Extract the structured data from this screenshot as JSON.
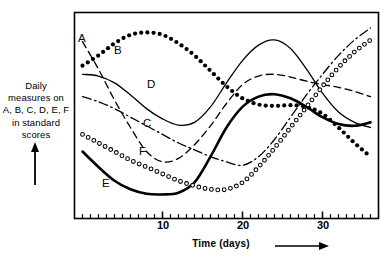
{
  "figure": {
    "kind": "line-chart",
    "background": "#ffffff",
    "ink_color": "#000000"
  },
  "axes": {
    "y_caption_lines": [
      "Daily",
      "measures on",
      "A, B, C, D, E, F",
      "in standard",
      "scores"
    ],
    "y_caption_text": "Daily measures on A, B, C, D, E, F in standard scores",
    "y_arrow": "up-arrow",
    "x_caption": "Time (days)",
    "x_arrow": "right-arrow",
    "x_tick_labels": [
      "10",
      "20",
      "30"
    ],
    "x_tick_values": [
      10,
      20,
      30
    ],
    "x_minor_tick_step": 1,
    "x_range": [
      -1,
      37
    ],
    "y_range": [
      -3,
      3
    ],
    "frame": true,
    "grid": false
  },
  "curve_labels": [
    {
      "id": "A",
      "text": "A",
      "x": 78,
      "y": 32
    },
    {
      "id": "B",
      "text": "B",
      "x": 114,
      "y": 44
    },
    {
      "id": "D",
      "text": "D",
      "x": 147,
      "y": 78
    },
    {
      "id": "C",
      "text": "C",
      "x": 143,
      "y": 117
    },
    {
      "id": "F",
      "text": "F",
      "x": 139,
      "y": 145
    },
    {
      "id": "E",
      "text": "E",
      "x": 102,
      "y": 177
    }
  ],
  "chart_data": {
    "type": "line",
    "title": "",
    "subtitle": "",
    "xlabel": "Time (days)",
    "ylabel": "Daily measures on A, B, C, D, E, F in standard scores",
    "xlim": [
      -1,
      37
    ],
    "ylim": [
      -3,
      3
    ],
    "xticks": [
      10,
      20,
      30
    ],
    "xtick_labels": [
      "10",
      "20",
      "30"
    ],
    "yticks": [],
    "ytick_labels": [],
    "grid": false,
    "legend": "inline-curve-labels",
    "legend_position": "on-curve",
    "x": [
      0,
      2,
      4,
      6,
      8,
      10,
      12,
      14,
      16,
      18,
      20,
      22,
      24,
      26,
      28,
      30,
      32,
      34,
      36
    ],
    "series": [
      {
        "name": "A",
        "label": "A",
        "style": "dashed",
        "linewidth": 1.3,
        "marker": "none",
        "color": "#000000",
        "values": [
          2.15,
          1.35,
          0.45,
          -0.35,
          -1.05,
          -1.35,
          -1.25,
          -0.85,
          -0.3,
          0.35,
          0.9,
          1.15,
          1.2,
          1.12,
          1.0,
          0.9,
          0.82,
          0.7,
          0.55
        ]
      },
      {
        "name": "B",
        "label": "B",
        "style": "dotted-thick",
        "linewidth": 3.4,
        "marker": "filled-circle",
        "color": "#000000",
        "values": [
          1.45,
          1.75,
          2.1,
          2.35,
          2.42,
          2.35,
          2.1,
          1.75,
          1.3,
          0.85,
          0.5,
          0.32,
          0.28,
          0.3,
          0.25,
          0.05,
          -0.35,
          -0.8,
          -1.2
        ]
      },
      {
        "name": "C",
        "label": "C",
        "style": "dash-dot",
        "linewidth": 1.3,
        "marker": "none",
        "color": "#000000",
        "values": [
          0.55,
          0.4,
          0.2,
          -0.05,
          -0.3,
          -0.55,
          -0.8,
          -1.0,
          -1.2,
          -1.35,
          -1.45,
          -1.2,
          -0.7,
          -0.05,
          0.6,
          1.2,
          1.75,
          2.2,
          2.55
        ]
      },
      {
        "name": "D",
        "label": "D",
        "style": "solid-thin",
        "linewidth": 1.3,
        "marker": "none",
        "color": "#000000",
        "values": [
          1.2,
          1.15,
          0.95,
          0.6,
          0.2,
          -0.1,
          -0.28,
          -0.2,
          0.25,
          0.95,
          1.6,
          2.05,
          2.2,
          1.95,
          1.35,
          0.65,
          0.1,
          -0.2,
          -0.35
        ]
      },
      {
        "name": "E",
        "label": "E",
        "style": "solid-thick",
        "linewidth": 2.6,
        "marker": "none",
        "color": "#000000",
        "values": [
          -1.05,
          -1.5,
          -1.9,
          -2.15,
          -2.28,
          -2.3,
          -2.25,
          -1.95,
          -1.2,
          -0.35,
          0.25,
          0.55,
          0.62,
          0.5,
          0.25,
          -0.05,
          -0.25,
          -0.3,
          -0.2
        ]
      },
      {
        "name": "F",
        "label": "F",
        "style": "open-circles",
        "linewidth": 1.2,
        "marker": "open-circle",
        "color": "#000000",
        "values": [
          -0.55,
          -0.8,
          -1.05,
          -1.3,
          -1.5,
          -1.7,
          -1.9,
          -2.05,
          -2.15,
          -2.15,
          -1.95,
          -1.5,
          -0.95,
          -0.35,
          0.25,
          0.85,
          1.4,
          1.85,
          2.2
        ]
      }
    ]
  }
}
